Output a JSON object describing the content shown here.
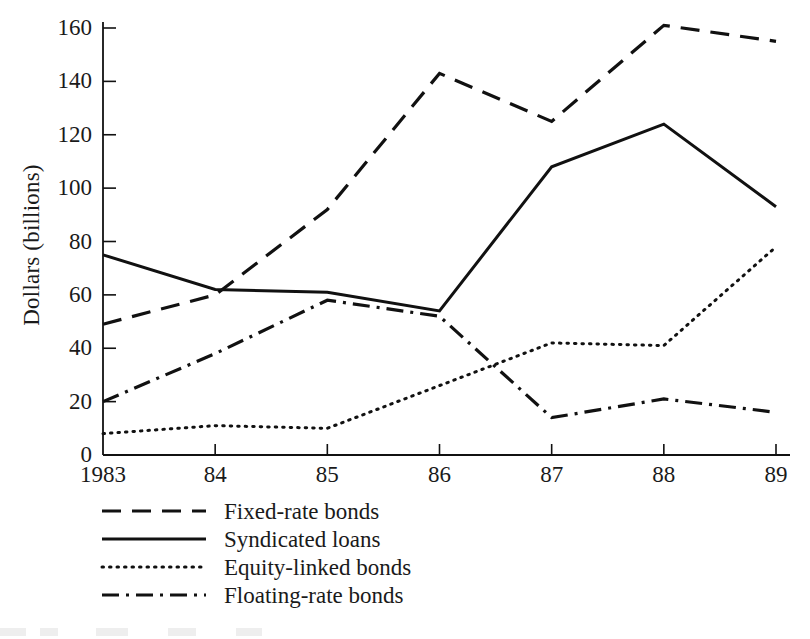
{
  "chart_data": {
    "type": "line",
    "title": "",
    "xlabel": "",
    "ylabel": "Dollars (billions)",
    "categories": [
      "1983",
      "84",
      "85",
      "86",
      "87",
      "88",
      "89"
    ],
    "x_tick_labels": [
      "1983",
      "84",
      "85",
      "86",
      "87",
      "88",
      "89"
    ],
    "y_tick_labels": [
      "0",
      "20",
      "40",
      "60",
      "80",
      "100",
      "120",
      "140",
      "160"
    ],
    "y_ticks": [
      0,
      20,
      40,
      60,
      80,
      100,
      120,
      140,
      160
    ],
    "ylim": [
      0,
      160
    ],
    "grid": false,
    "legend_position": "below-axes-left",
    "series": [
      {
        "name": "Fixed-rate bonds",
        "line_style": "dashed",
        "color": "#111111",
        "values": [
          49,
          60,
          92,
          143,
          125,
          161,
          155
        ]
      },
      {
        "name": "Syndicated loans",
        "line_style": "solid",
        "color": "#111111",
        "values": [
          75,
          62,
          61,
          54,
          108,
          124,
          93
        ]
      },
      {
        "name": "Equity-linked bonds",
        "line_style": "dotted",
        "color": "#111111",
        "values": [
          8,
          11,
          10,
          26,
          42,
          41,
          78
        ]
      },
      {
        "name": "Floating-rate bonds",
        "line_style": "dash-dot",
        "color": "#111111",
        "values": [
          20,
          38,
          58,
          52,
          14,
          21,
          16
        ]
      }
    ]
  },
  "legend": {
    "items": [
      {
        "label": "Fixed-rate bonds",
        "style": "dashed"
      },
      {
        "label": "Syndicated loans",
        "style": "solid"
      },
      {
        "label": "Equity-linked bonds",
        "style": "dotted"
      },
      {
        "label": "Floating-rate bonds",
        "style": "dash-dot"
      }
    ]
  }
}
